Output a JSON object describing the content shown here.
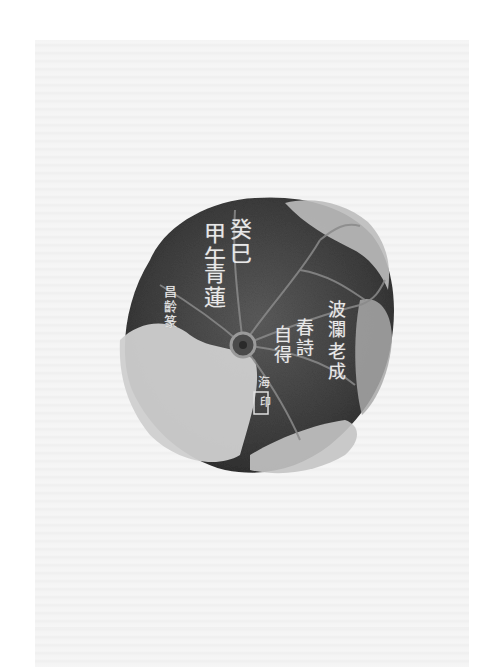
{
  "image": {
    "subject": "Ink rubbing of a lotus-leaf shaped inkstone",
    "colors": {
      "paper": "#f4f4f4",
      "stone_dark": "#3a3a3a",
      "stone_mid": "#5a5a5a",
      "rock_light": "#c8c8c8",
      "vein": "#8a8a8a",
      "inscription": "#e8e8e8"
    },
    "inscriptions": {
      "left_main": [
        "癸巳",
        "甲午",
        "青蓮"
      ],
      "left_col1": "癸巳",
      "left_col2": "甲午",
      "left_col3": "青蓮",
      "left_small": "昌齡篆",
      "right_col1": "波瀾",
      "right_col2": "老成",
      "right_col3": "春詩",
      "right_col4": "自得",
      "seal_char": "海",
      "seal_label": "印"
    }
  }
}
